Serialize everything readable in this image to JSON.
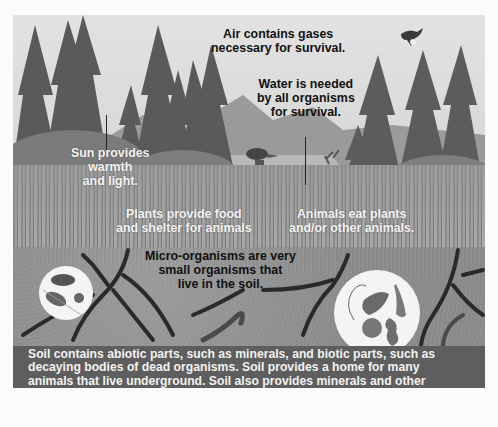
{
  "figure": {
    "labels": {
      "air": [
        "Air contains gases",
        "necessary for survival."
      ],
      "water": [
        "Water is needed",
        "by all organisms",
        "for survival."
      ],
      "sun": [
        "Sun provides",
        "warmth",
        "and light."
      ],
      "plants": [
        "Plants provide food",
        "and shelter for animals"
      ],
      "animals": [
        "Animals eat plants",
        "and/or other animals."
      ],
      "micro": [
        "Micro-organisms are very",
        "small organisms that",
        "live in the soil."
      ]
    },
    "caption": [
      "Soil contains abiotic parts, such as minerals, and biotic parts, such as",
      "decaying  bodies of dead organisms. Soil provides a home for many",
      "animals that live underground. Soil also provides minerals and other",
      "nutrients for plants."
    ],
    "illustrations": [
      "conifer-trees",
      "mountains",
      "lake",
      "bird-on-post",
      "deer",
      "flying-eagle",
      "grass",
      "soil",
      "roots",
      "worms",
      "soil-insects-inset",
      "microorganisms-inset"
    ],
    "colors": {
      "caption_bg": "#5e5e5e",
      "soil": "#8f8f8f",
      "sky": "#dedede"
    }
  }
}
